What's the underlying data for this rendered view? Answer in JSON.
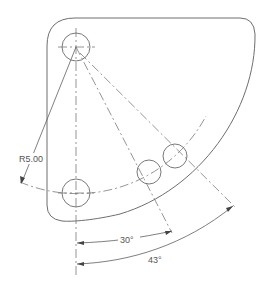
{
  "drawing": {
    "title": "Bolt circle pattern plate",
    "colors": {
      "outline": "#6e6e6e",
      "dimension": "#555555",
      "background": "#ffffff"
    },
    "dimensions": {
      "radius_label": "R5.00",
      "angle_1_label": "30°",
      "angle_2_label": "43°"
    },
    "holes": [
      {
        "name": "pivot-hole",
        "cx": 76,
        "cy": 47,
        "r": 14
      },
      {
        "name": "bottom-hole",
        "cx": 76,
        "cy": 193,
        "r": 14
      },
      {
        "name": "hole-30deg",
        "cx": 149,
        "cy": 172,
        "r": 12
      },
      {
        "name": "hole-43deg",
        "cx": 175,
        "cy": 156,
        "r": 12
      }
    ]
  }
}
